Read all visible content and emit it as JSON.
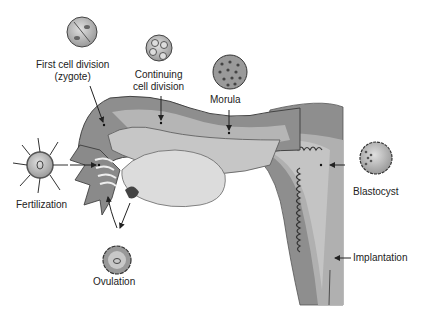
{
  "diagram": {
    "title": "",
    "labels": {
      "first_cell_division_line1": "First cell division",
      "first_cell_division_line2": "(zygote)",
      "continuing_line1": "Continuing",
      "continuing_line2": "cell division",
      "morula": "Morula",
      "fertilization": "Fertilization",
      "ovulation": "Ovulation",
      "blastocyst": "Blastocyst",
      "implantation": "Implantation"
    },
    "stages": [
      {
        "name": "Ovulation",
        "order": 1
      },
      {
        "name": "Fertilization",
        "order": 2
      },
      {
        "name": "First cell division (zygote)",
        "order": 3
      },
      {
        "name": "Continuing cell division",
        "order": 4
      },
      {
        "name": "Morula",
        "order": 5
      },
      {
        "name": "Blastocyst",
        "order": 6
      },
      {
        "name": "Implantation",
        "order": 7
      }
    ],
    "colors": {
      "outer_wall": "#8a8a8a",
      "middle_layer": "#a9a9a9",
      "inner_layer": "#c8c8c8",
      "ovary": "#dcdcdc",
      "cell_fill": "#bdbdbd",
      "outline": "#333333",
      "text": "#222222"
    }
  }
}
